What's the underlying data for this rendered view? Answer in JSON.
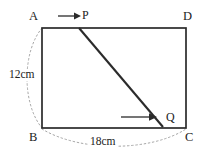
{
  "figure": {
    "type": "geometry-diagram",
    "background_color": "#ffffff",
    "stroke_color": "#2b2b2b",
    "dotted_color": "#9a9a9a",
    "vertices": [
      {
        "name": "A",
        "label": "A",
        "position": "top-left"
      },
      {
        "name": "D",
        "label": "D",
        "position": "top-right"
      },
      {
        "name": "B",
        "label": "B",
        "position": "bottom-left"
      },
      {
        "name": "C",
        "label": "C",
        "position": "bottom-right"
      }
    ],
    "points": [
      {
        "name": "P",
        "label": "P",
        "on_side": "AD"
      },
      {
        "name": "Q",
        "label": "Q",
        "on_side": "BC"
      }
    ],
    "dimensions": [
      {
        "name": "height-AB",
        "label": "12cm",
        "side": "AB",
        "value": 12,
        "unit": "cm"
      },
      {
        "name": "width-BC",
        "label": "18cm",
        "side": "BC",
        "value": 18,
        "unit": "cm"
      }
    ],
    "arrows": [
      {
        "name": "arrow-to-P",
        "direction": "right",
        "near": "P"
      },
      {
        "name": "arrow-to-Q",
        "direction": "right",
        "near": "Q"
      }
    ],
    "segments": [
      {
        "name": "segment-PQ",
        "from": "P",
        "to": "Q"
      }
    ]
  }
}
